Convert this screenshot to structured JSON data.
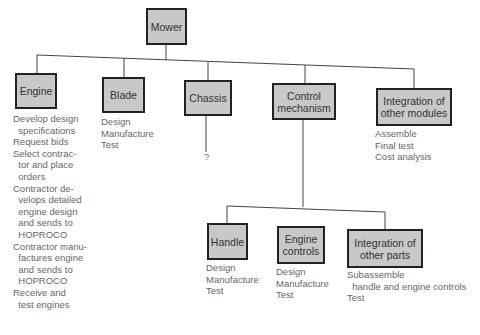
{
  "root": {
    "label": "Mower"
  },
  "modules": [
    {
      "label": "Engine",
      "tasks": [
        "Develop design",
        "  specifications",
        "Request bids",
        "Select contrac-",
        "  tor and place",
        "  orders",
        "Contractor de-",
        "  velops detailed",
        "  engine design",
        "  and sends to",
        "  HOPROCO",
        "Contractor manu-",
        "  factures engine",
        "  and sends to",
        "  HOPROCO",
        "Receive and",
        "  test engines"
      ]
    },
    {
      "label": "Blade",
      "tasks": [
        "Design",
        "Manufacture",
        "Test"
      ]
    },
    {
      "label": "Chassis",
      "tasks": [
        "?"
      ]
    },
    {
      "label": "Control mechanism",
      "tasks": []
    },
    {
      "label": "Integration of other modules",
      "tasks": [
        "Assemble",
        "Final test",
        "Cost analysis"
      ]
    }
  ],
  "submodules": [
    {
      "label": "Handle",
      "tasks": [
        "Design",
        "Manufacture",
        "Test"
      ]
    },
    {
      "label": "Engine controls",
      "tasks": [
        "Design",
        "Manufacture",
        "Test"
      ]
    },
    {
      "label": "Integration of other parts",
      "tasks": [
        "Subassemble",
        "  handle and engine controls",
        "Test"
      ]
    }
  ],
  "colors": {
    "box_fill": "#c8c8c8",
    "box_border": "#222222",
    "line": "#444444",
    "text": "#666666"
  }
}
